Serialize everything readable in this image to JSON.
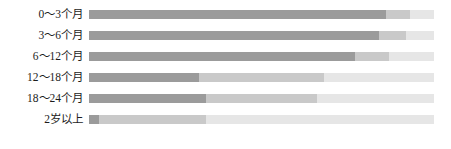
{
  "chart_data": {
    "type": "bar",
    "orientation": "horizontal",
    "stacked": true,
    "title": "",
    "subtitle": "",
    "xlabel": "",
    "ylabel": "",
    "xlim": [
      0,
      100
    ],
    "grid": false,
    "legend": "none",
    "categories": [
      "0～3个月",
      "3～6个月",
      "6～12个月",
      "12～18个月",
      "18～24个月",
      "2岁以上"
    ],
    "series": [
      {
        "name": "segment-1",
        "color": "#9b9b9b",
        "values": [
          86,
          84,
          77,
          32,
          34,
          3
        ]
      },
      {
        "name": "segment-2",
        "color": "#c9c9c9",
        "values": [
          7,
          8,
          10,
          36,
          32,
          31
        ]
      },
      {
        "name": "segment-3",
        "color": "#e6e6e6",
        "values": [
          7,
          8,
          13,
          32,
          34,
          66
        ]
      }
    ],
    "rows": [
      {
        "label": "0～3个月",
        "segments": [
          86,
          7,
          7
        ]
      },
      {
        "label": "3～6个月",
        "segments": [
          84,
          8,
          8
        ]
      },
      {
        "label": "6～12个月",
        "segments": [
          77,
          10,
          13
        ]
      },
      {
        "label": "12～18个月",
        "segments": [
          32,
          36,
          32
        ]
      },
      {
        "label": "18～24个月",
        "segments": [
          34,
          32,
          34
        ]
      },
      {
        "label": "2岁以上",
        "segments": [
          3,
          31,
          66
        ]
      }
    ]
  },
  "colors": {
    "segment_dark": "#9b9b9b",
    "segment_mid": "#c9c9c9",
    "segment_light": "#e6e6e6",
    "label_text": "#1c1c1c",
    "background": "#ffffff"
  }
}
